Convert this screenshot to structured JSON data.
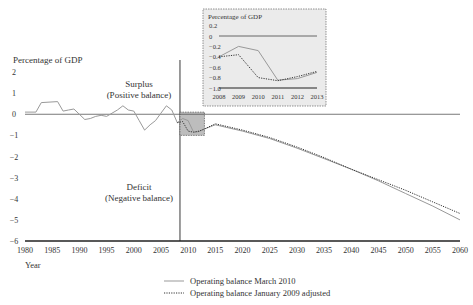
{
  "chart_data": [
    {
      "type": "line",
      "title": "",
      "ylabel": "Percentage of GDP",
      "xlabel": "Year",
      "xlim": [
        1980,
        2060
      ],
      "ylim": [
        -6,
        2
      ],
      "x_ticks": [
        "1980",
        "1985",
        "1990",
        "1995",
        "2000",
        "2005",
        "2010",
        "2015",
        "2020",
        "2025",
        "2030",
        "2035",
        "2040",
        "2045",
        "2050",
        "2055",
        "2060"
      ],
      "y_ticks": [
        "2",
        "1",
        "0",
        "−1",
        "−2",
        "−3",
        "−4",
        "−5",
        "−6"
      ],
      "annotations": {
        "surplus": [
          "Surplus",
          "(Positive balance)"
        ],
        "deficit": [
          "Deficit",
          "(Negative balance)"
        ]
      },
      "vertical_marker_year": 2008.5,
      "highlight_box": {
        "x": [
          2008.5,
          2013
        ],
        "y": [
          -1.0,
          0.1
        ]
      },
      "series": [
        {
          "name": "Operating balance March 2010",
          "style": "solid",
          "x": [
            1980,
            1982,
            1983,
            1986,
            1987,
            1988,
            1989,
            1990,
            1991,
            1992,
            1993,
            1994,
            1995,
            1996,
            1997,
            1998,
            1999,
            2000,
            2001,
            2002,
            2003,
            2004,
            2005,
            2006,
            2007,
            2008,
            2009,
            2010,
            2011,
            2012,
            2013,
            2015,
            2020,
            2025,
            2030,
            2035,
            2040,
            2045,
            2050,
            2055,
            2060
          ],
          "values": [
            0.1,
            0.1,
            0.55,
            0.6,
            0.15,
            0.2,
            0.25,
            0.0,
            -0.25,
            -0.2,
            -0.1,
            -0.05,
            -0.1,
            0.05,
            0.2,
            0.4,
            0.2,
            0.15,
            -0.3,
            -0.75,
            -0.5,
            -0.3,
            0.05,
            0.4,
            0.2,
            -0.4,
            -0.2,
            -0.3,
            -0.85,
            -0.82,
            -0.7,
            -0.5,
            -0.8,
            -1.15,
            -1.6,
            -2.1,
            -2.6,
            -3.15,
            -3.75,
            -4.35,
            -5.0
          ]
        },
        {
          "name": "Operating balance January 2009 adjusted",
          "style": "dotted",
          "x": [
            2008,
            2009,
            2010,
            2011,
            2012,
            2013,
            2015,
            2020,
            2025,
            2030,
            2035,
            2040,
            2045,
            2050,
            2055,
            2060
          ],
          "values": [
            -0.4,
            -0.35,
            -0.8,
            -0.85,
            -0.8,
            -0.7,
            -0.45,
            -0.75,
            -1.1,
            -1.55,
            -2.05,
            -2.6,
            -3.1,
            -3.6,
            -4.15,
            -4.7
          ]
        }
      ],
      "legend_position": "bottom-center"
    },
    {
      "type": "line",
      "title": "",
      "ylabel": "Percentage of GDP",
      "xlim": [
        2008,
        2013
      ],
      "ylim": [
        -1.0,
        0.2
      ],
      "x_ticks": [
        "2008",
        "2009",
        "2010",
        "2011",
        "2012",
        "2013"
      ],
      "y_ticks": [
        "0.2",
        "0",
        "−0.2",
        "−0.4",
        "−0.6",
        "−0.8",
        "−1.0"
      ],
      "series": [
        {
          "name": "Operating balance March 2010",
          "style": "solid",
          "x": [
            2008,
            2009,
            2010,
            2011,
            2012,
            2013
          ],
          "values": [
            -0.4,
            -0.2,
            -0.28,
            -0.85,
            -0.82,
            -0.7
          ]
        },
        {
          "name": "Operating balance January 2009 adjusted",
          "style": "dotted",
          "x": [
            2008,
            2009,
            2010,
            2011,
            2012,
            2013
          ],
          "values": [
            -0.4,
            -0.36,
            -0.8,
            -0.86,
            -0.78,
            -0.68
          ]
        }
      ]
    }
  ],
  "labels": {
    "ylabel": "Percentage of GDP",
    "xlabel": "Year",
    "surplus_line1": "Surplus",
    "surplus_line2": "(Positive balance)",
    "deficit_line1": "Deficit",
    "deficit_line2": "(Negative balance)",
    "inset_ylabel": "Percentage of GDP"
  },
  "legend": [
    {
      "label": "Operating balance March 2010",
      "style": "solid",
      "color": "#999999"
    },
    {
      "label": "Operating balance January 2009 adjusted",
      "style": "dotted",
      "color": "#333333"
    }
  ],
  "colors": {
    "solid_series": "#999999",
    "dotted_series": "#333333",
    "inset_bg": "#ebebeb",
    "highlight_box": "#bdbdbd",
    "axis": "#222222"
  }
}
